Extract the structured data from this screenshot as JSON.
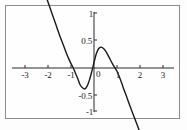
{
  "figure": {
    "frame_color": "#8c8c8c",
    "background_color": "#fefefe",
    "axis_color": "#2b2b2b",
    "curve_color": "#1a1a1a"
  },
  "chart_data": {
    "type": "line",
    "title": "",
    "xlabel": "",
    "ylabel": "",
    "xlim": [
      -3.35,
      3.35
    ],
    "ylim": [
      -1.2,
      1.18
    ],
    "grid": false,
    "legend": null,
    "xticks": [
      -3,
      -2,
      -1,
      1,
      2,
      3
    ],
    "xtick_labels": [
      "-3",
      "-2",
      "-1",
      "1",
      "2",
      "3"
    ],
    "yticks": [
      -1,
      -0.5,
      0.5,
      1
    ],
    "ytick_labels": [
      "-1",
      "-0.5",
      "0.5",
      "1"
    ],
    "origin_label": "0",
    "series": [
      {
        "name": "curve",
        "description": "cubic curve descending from upper-left, local minimum near (-0.55,-0.38), local maximum near (0.25,0.38), descending to lower-right",
        "x": [
          -2.1,
          -2.0,
          -1.9,
          -1.8,
          -1.7,
          -1.6,
          -1.5,
          -1.4,
          -1.3,
          -1.2,
          -1.1,
          -1.0,
          -0.9,
          -0.8,
          -0.7,
          -0.6,
          -0.5,
          -0.4,
          -0.3,
          -0.2,
          -0.1,
          0.0,
          0.1,
          0.2,
          0.3,
          0.4,
          0.5,
          0.6,
          0.7,
          0.8,
          0.9,
          1.0,
          1.1,
          1.2,
          1.3,
          1.4,
          1.5,
          1.6,
          1.7,
          1.8,
          1.9,
          2.0,
          2.1,
          2.2,
          2.3,
          2.4
        ],
        "y": [
          1.31,
          1.2,
          1.08,
          0.96,
          0.84,
          0.72,
          0.6,
          0.49,
          0.38,
          0.27,
          0.17,
          0.08,
          0.0,
          -0.1,
          -0.2,
          -0.31,
          -0.36,
          -0.38,
          -0.33,
          -0.22,
          -0.07,
          0.1,
          0.26,
          0.35,
          0.38,
          0.36,
          0.31,
          0.24,
          0.16,
          0.08,
          0.01,
          -0.06,
          -0.16,
          -0.27,
          -0.39,
          -0.5,
          -0.62,
          -0.73,
          -0.84,
          -0.95,
          -1.06,
          -1.17,
          -1.27,
          -1.37,
          -1.46,
          -1.55
        ]
      }
    ]
  }
}
